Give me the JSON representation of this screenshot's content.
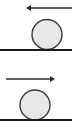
{
  "figure": {
    "type": "physics-diagram",
    "width": 72,
    "height": 133,
    "background_color": "#ffffff",
    "colors": {
      "ball_fill": "#e8e8e8",
      "ball_stroke": "#3a3a3a",
      "ground_line": "#1a1a1a",
      "arrow": "#2b2b2b"
    },
    "panels": [
      {
        "id": "panel-top",
        "label": "",
        "arrow": {
          "name": "leftward-arrow",
          "direction": "left",
          "x_start": 72,
          "x_end": 26,
          "y": 8,
          "stroke_width": 1.6,
          "head_length": 5,
          "head_width": 6
        },
        "ball": {
          "name": "ball",
          "cx": 47,
          "cy": 34.5,
          "r": 15,
          "stroke_width": 1.4
        },
        "ground": {
          "name": "ground-line",
          "x_start": 0,
          "x_end": 72,
          "y": 50,
          "stroke_width": 2.2
        }
      },
      {
        "id": "panel-bottom",
        "label": "",
        "arrow": {
          "name": "rightward-arrow",
          "direction": "right",
          "x_start": 6,
          "x_end": 55,
          "y": 12,
          "stroke_width": 1.6,
          "head_length": 5,
          "head_width": 6
        },
        "ball": {
          "name": "ball",
          "cx": 35,
          "cy": 38,
          "r": 15,
          "stroke_width": 1.4
        },
        "ground": {
          "name": "ground-line",
          "x_start": 0,
          "x_end": 72,
          "y": 53,
          "stroke_width": 2.2
        }
      }
    ]
  }
}
